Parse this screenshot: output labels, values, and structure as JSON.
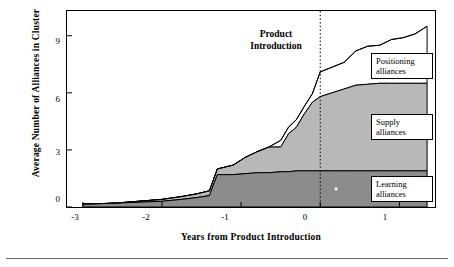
{
  "chart_data": {
    "type": "area",
    "title": "",
    "xlabel": "Years from Product Introduction",
    "ylabel": "Average Number of Alliances in Cluster",
    "xlim": [
      -3.2,
      1.45
    ],
    "ylim": [
      0,
      10.3
    ],
    "xticks": [
      -3,
      -2,
      -1,
      0,
      1
    ],
    "xticklabels": [
      "-3",
      "-2",
      "-1",
      "0",
      "1"
    ],
    "yticks": [
      0,
      3,
      6,
      9
    ],
    "yticklabels": [
      "0",
      "3",
      "6",
      "9"
    ],
    "grid": false,
    "legend_position": "inline-callouts",
    "stacked": true,
    "annotations": [
      {
        "name": "product-introduction",
        "text": "Product\nIntroduction",
        "x": -0.35,
        "y": 9.4
      },
      {
        "name": "vertical-reference-line",
        "x": 0,
        "style": "dotted"
      }
    ],
    "x": [
      -3.0,
      -2.6,
      -2.3,
      -2.0,
      -1.75,
      -1.55,
      -1.4,
      -1.3,
      -1.1,
      -0.95,
      -0.8,
      -0.65,
      -0.5,
      -0.4,
      -0.3,
      -0.2,
      -0.1,
      0.0,
      0.15,
      0.3,
      0.45,
      0.6,
      0.75,
      0.9,
      1.05,
      1.2,
      1.35
    ],
    "series": [
      {
        "name": "Learning alliances",
        "label": "Learning\nalliances",
        "color": "#8c8c8c",
        "values": [
          0.15,
          0.2,
          0.25,
          0.3,
          0.4,
          0.5,
          0.6,
          1.7,
          1.7,
          1.75,
          1.8,
          1.8,
          1.85,
          1.85,
          1.9,
          1.9,
          1.9,
          1.9,
          1.9,
          1.9,
          1.9,
          1.9,
          1.9,
          1.9,
          1.9,
          1.9,
          1.9
        ]
      },
      {
        "name": "Supply alliances",
        "label": "Supply\nalliances",
        "color": "#b8b8b8",
        "values": [
          0.0,
          0.0,
          0.05,
          0.1,
          0.15,
          0.2,
          0.25,
          0.3,
          0.5,
          0.85,
          1.1,
          1.35,
          1.3,
          2.0,
          2.3,
          3.0,
          3.6,
          3.9,
          4.1,
          4.3,
          4.5,
          4.55,
          4.6,
          4.6,
          4.6,
          4.6,
          4.6
        ]
      },
      {
        "name": "Positioning alliances",
        "label": "Positioning\nalliances",
        "color": "#ffffff",
        "values": [
          0.0,
          0.0,
          0.0,
          0.0,
          0.0,
          0.0,
          0.0,
          0.0,
          0.0,
          0.0,
          0.0,
          0.0,
          0.35,
          0.35,
          0.4,
          0.4,
          0.45,
          1.3,
          1.35,
          1.4,
          1.8,
          2.0,
          2.0,
          2.3,
          2.4,
          2.6,
          3.0
        ]
      }
    ],
    "cumulative_top": [
      0.15,
      0.2,
      0.3,
      0.4,
      0.55,
      0.7,
      0.85,
      2.0,
      2.2,
      2.6,
      2.9,
      3.15,
      3.5,
      4.2,
      4.6,
      5.3,
      5.95,
      7.1,
      7.35,
      7.6,
      8.2,
      8.45,
      8.5,
      8.8,
      8.9,
      9.1,
      9.5
    ]
  },
  "labels": {
    "learning": "Learning\nalliances",
    "supply": "Supply\nalliances",
    "positioning": "Positioning\nalliances",
    "product_introduction": "Product\nIntroduction",
    "y_axis_title": "Average Number of Alliances in Cluster",
    "x_axis_title": "Years from Product Introduction",
    "ytick_0": "0",
    "ytick_3": "3",
    "ytick_6": "6",
    "ytick_9": "9",
    "xtick_m3": "-3",
    "xtick_m2": "-2",
    "xtick_m1": "-1",
    "xtick_0": "0",
    "xtick_1": "1"
  },
  "colors": {
    "learning_fill": "#8c8c8c",
    "supply_fill": "#b8b8b8",
    "positioning_fill": "#ffffff",
    "axis": "#000000",
    "background": "#ffffff"
  }
}
